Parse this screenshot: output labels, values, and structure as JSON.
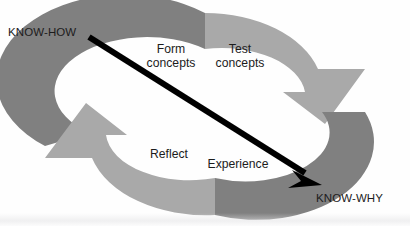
{
  "diagram": {
    "type": "cyclic-two-arrow-ring",
    "background_color": "#fefefe",
    "colors": {
      "arrow_dark_gray": "#808080",
      "arrow_light_gray": "#a9a9a9",
      "diagonal_arrow": "#000000",
      "label_text": "#1c1c1c"
    },
    "endpoints": [
      {
        "id": "know-how",
        "label": "KNOW-HOW",
        "position": "top-left"
      },
      {
        "id": "know-why",
        "label": "KNOW-WHY",
        "position": "bottom-right"
      }
    ],
    "stages": [
      {
        "id": "form-concepts",
        "line1": "Form",
        "line2": "concepts",
        "quadrant": "top-left-inner"
      },
      {
        "id": "test-concepts",
        "line1": "Test",
        "line2": "concepts",
        "quadrant": "top-right-inner"
      },
      {
        "id": "reflect",
        "line1": "Reflect",
        "line2": "",
        "quadrant": "bottom-left-inner"
      },
      {
        "id": "experience",
        "line1": "Experience",
        "line2": "",
        "quadrant": "bottom-right-inner"
      }
    ],
    "arrows": {
      "upper_ring": {
        "direction": "clockwise",
        "from": "left",
        "to": "right",
        "head": "down-right"
      },
      "lower_ring": {
        "direction": "clockwise",
        "from": "right",
        "to": "left",
        "head": "up-left"
      },
      "diagonal": {
        "from_label": "KNOW-HOW",
        "to_label": "KNOW-WHY",
        "head": "bottom-right"
      }
    }
  }
}
